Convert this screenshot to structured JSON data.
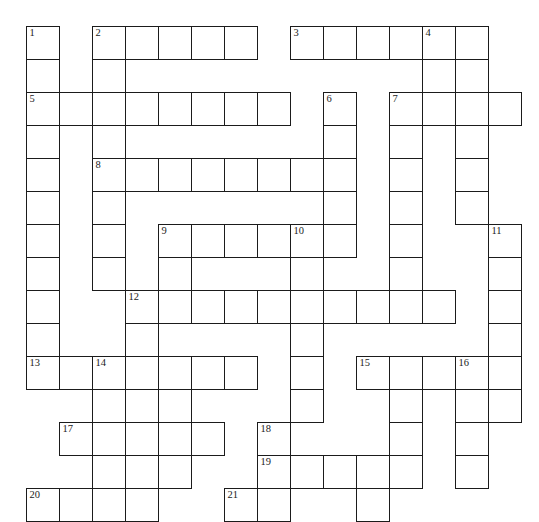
{
  "page": {
    "background_color": "#ffffff",
    "width": 539,
    "height": 520
  },
  "grid": {
    "cell_size": 33,
    "origin_x": 26,
    "origin_y": 26,
    "columns": 15,
    "rows": 16,
    "line_color": "#1b1b1b",
    "cell_fill": "#ffffff",
    "blocked_fill": "#0d0d0d",
    "blocked_cells": [
      [
        3,
        12
      ],
      [
        3,
        14
      ]
    ],
    "rows_cells": [
      {
        "row": 0,
        "runs": [
          [
            0,
            0
          ],
          [
            2,
            6
          ],
          [
            8,
            13
          ]
        ]
      },
      {
        "row": 1,
        "runs": [
          [
            0,
            0
          ],
          [
            2,
            2
          ],
          [
            12,
            12
          ],
          [
            13,
            13
          ]
        ]
      },
      {
        "row": 2,
        "runs": [
          [
            0,
            7
          ],
          [
            9,
            9
          ],
          [
            11,
            14
          ]
        ]
      },
      {
        "row": 3,
        "runs": [
          [
            0,
            0
          ],
          [
            2,
            2
          ],
          [
            9,
            9
          ],
          [
            11,
            11
          ],
          [
            13,
            13
          ]
        ]
      },
      {
        "row": 4,
        "runs": [
          [
            0,
            0
          ],
          [
            2,
            9
          ],
          [
            11,
            11
          ],
          [
            13,
            13
          ]
        ]
      },
      {
        "row": 5,
        "runs": [
          [
            0,
            0
          ],
          [
            2,
            2
          ],
          [
            9,
            9
          ],
          [
            11,
            11
          ],
          [
            13,
            13
          ]
        ]
      },
      {
        "row": 6,
        "runs": [
          [
            0,
            0
          ],
          [
            2,
            2
          ],
          [
            4,
            9
          ],
          [
            11,
            11
          ],
          [
            14,
            14
          ]
        ]
      },
      {
        "row": 7,
        "runs": [
          [
            0,
            0
          ],
          [
            2,
            2
          ],
          [
            4,
            4
          ],
          [
            8,
            8
          ],
          [
            11,
            11
          ],
          [
            14,
            14
          ]
        ]
      },
      {
        "row": 8,
        "runs": [
          [
            0,
            0
          ],
          [
            3,
            12
          ],
          [
            14,
            14
          ]
        ]
      },
      {
        "row": 9,
        "runs": [
          [
            0,
            0
          ],
          [
            3,
            3
          ],
          [
            8,
            8
          ],
          [
            14,
            14
          ]
        ]
      },
      {
        "row": 10,
        "runs": [
          [
            0,
            6
          ],
          [
            8,
            8
          ],
          [
            10,
            14
          ]
        ]
      },
      {
        "row": 11,
        "runs": [
          [
            2,
            4
          ],
          [
            8,
            8
          ],
          [
            11,
            11
          ],
          [
            13,
            13
          ],
          [
            14,
            14
          ]
        ]
      },
      {
        "row": 12,
        "runs": [
          [
            1,
            5
          ],
          [
            7,
            7
          ],
          [
            11,
            11
          ],
          [
            13,
            13
          ]
        ]
      },
      {
        "row": 13,
        "runs": [
          [
            2,
            4
          ],
          [
            7,
            11
          ],
          [
            13,
            13
          ]
        ]
      },
      {
        "row": 14,
        "runs": [
          [
            0,
            3
          ],
          [
            6,
            7
          ],
          [
            10,
            10
          ]
        ]
      }
    ],
    "clue_numbers": [
      {
        "n": "1",
        "row": 0,
        "col": 0
      },
      {
        "n": "2",
        "row": 0,
        "col": 2
      },
      {
        "n": "3",
        "row": 0,
        "col": 8
      },
      {
        "n": "4",
        "row": 0,
        "col": 12
      },
      {
        "n": "5",
        "row": 2,
        "col": 0
      },
      {
        "n": "6",
        "row": 2,
        "col": 9
      },
      {
        "n": "7",
        "row": 2,
        "col": 11
      },
      {
        "n": "8",
        "row": 4,
        "col": 2
      },
      {
        "n": "9",
        "row": 6,
        "col": 4
      },
      {
        "n": "10",
        "row": 6,
        "col": 8
      },
      {
        "n": "11",
        "row": 6,
        "col": 14
      },
      {
        "n": "12",
        "row": 8,
        "col": 3
      },
      {
        "n": "13",
        "row": 10,
        "col": 0
      },
      {
        "n": "14",
        "row": 10,
        "col": 2
      },
      {
        "n": "15",
        "row": 10,
        "col": 10
      },
      {
        "n": "16",
        "row": 10,
        "col": 13
      },
      {
        "n": "17",
        "row": 12,
        "col": 1
      },
      {
        "n": "18",
        "row": 12,
        "col": 7
      },
      {
        "n": "19",
        "row": 13,
        "col": 7
      },
      {
        "n": "20",
        "row": 14,
        "col": 0
      },
      {
        "n": "21",
        "row": 14,
        "col": 6
      }
    ],
    "letters": []
  }
}
